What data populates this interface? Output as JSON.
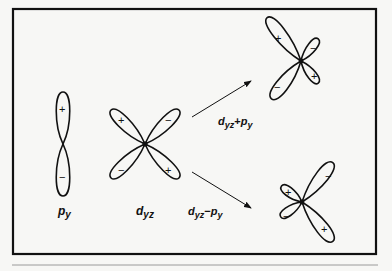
{
  "figure": {
    "background": "#f7f7f5",
    "stroke_color": "#111111",
    "orbitals": {
      "p_y": {
        "label_main": "p",
        "label_sub": "y",
        "signs": [
          "+",
          "−"
        ]
      },
      "d_yz": {
        "label_main": "d",
        "label_sub": "yz",
        "signs": [
          "+",
          "−",
          "−",
          "+"
        ]
      },
      "hybrid_plus": {
        "signs": [
          "+",
          "−",
          "−",
          "+"
        ]
      },
      "hybrid_minus": {
        "signs": [
          "−",
          "+",
          "−",
          "+"
        ]
      }
    },
    "arrows": {
      "upper": {
        "label_d": "d",
        "label_d_sub": "yz",
        "label_op": "+",
        "label_p": "p",
        "label_p_sub": "y"
      },
      "lower": {
        "label_d": "d",
        "label_d_sub": "yz",
        "label_op": "−",
        "label_p": "p",
        "label_p_sub": "y"
      }
    }
  }
}
